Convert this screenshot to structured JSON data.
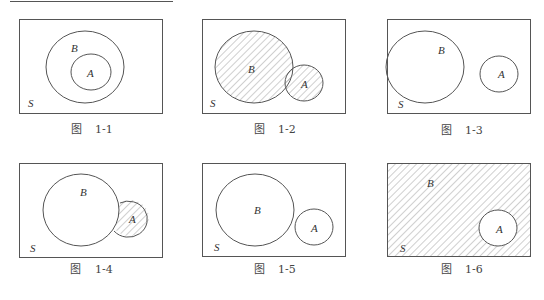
{
  "figures": [
    {
      "id": "1-1",
      "caption_prefix": "图",
      "caption_num": "1-1",
      "labels": {
        "A": "A",
        "B": "B",
        "S": "S"
      },
      "description": "A subset of B, no shading"
    },
    {
      "id": "1-2",
      "caption_prefix": "图",
      "caption_num": "1-2",
      "labels": {
        "A": "A",
        "B": "B",
        "S": "S"
      },
      "description": "Union of A and B shaded"
    },
    {
      "id": "1-3",
      "caption_prefix": "图",
      "caption_num": "1-3",
      "labels": {
        "A": "A",
        "B": "B",
        "S": "S"
      },
      "description": "Intersection of A and B shaded"
    },
    {
      "id": "1-4",
      "caption_prefix": "图",
      "caption_num": "1-4",
      "labels": {
        "A": "A",
        "B": "B",
        "S": "S"
      },
      "description": "A minus B shaded"
    },
    {
      "id": "1-5",
      "caption_prefix": "图",
      "caption_num": "1-5",
      "labels": {
        "A": "A",
        "B": "B",
        "S": "S"
      },
      "description": "A and B disjoint, no shading"
    },
    {
      "id": "1-6",
      "caption_prefix": "图",
      "caption_num": "1-6",
      "labels": {
        "A": "A",
        "B": "B",
        "S": "S"
      },
      "description": "Complement of A shaded (B = complement of A)"
    }
  ],
  "colors": {
    "stroke": "#555555",
    "hatch": "#888888",
    "text": "#333333"
  }
}
